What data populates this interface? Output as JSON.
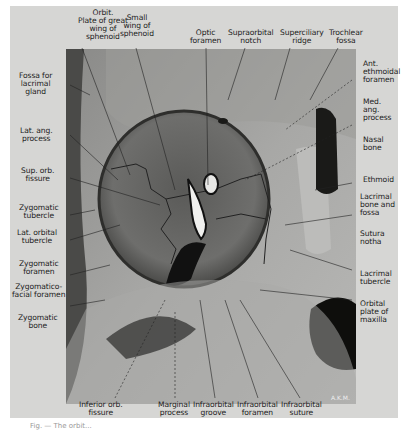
{
  "figure": {
    "signature": "A.K.M.",
    "caption_fragment": "Fig. — The orbit..."
  },
  "labels": {
    "top": [
      {
        "id": "orbit-plate",
        "text": "Orbit.\nPlate of great\nwing of\nsphenoid"
      },
      {
        "id": "small-wing",
        "text": "Small\nwing of\nsphenoid"
      },
      {
        "id": "optic-foramen",
        "text": "Optic\nforamen"
      },
      {
        "id": "supraorbital-notch",
        "text": "Supraorbital\nnotch"
      },
      {
        "id": "superciliary-ridge",
        "text": "Superciliary\nridge"
      },
      {
        "id": "trochlear-fossa",
        "text": "Trochlear\nfossa"
      }
    ],
    "left": [
      {
        "id": "fossa-lacrimal-gland",
        "text": "Fossa for\nlacrimal\ngland"
      },
      {
        "id": "lat-ang-process",
        "text": "Lat. ang.\nprocess"
      },
      {
        "id": "sup-orb-fissure",
        "text": "Sup. orb.\nfissure"
      },
      {
        "id": "zygomatic-tubercle",
        "text": "Zygomatic\ntubercle"
      },
      {
        "id": "lat-orbital-tubercle",
        "text": "Lat. orbital\ntubercle"
      },
      {
        "id": "zygomatic-foramen",
        "text": "Zygomatic\nforamen"
      },
      {
        "id": "zygomaticofacial-foramen",
        "text": "Zygomatico-\nfacial foramen"
      },
      {
        "id": "zygomatic-bone",
        "text": "Zygomatic\nbone"
      }
    ],
    "right": [
      {
        "id": "ant-ethmoidal-foramen",
        "text": "Ant.\nethmoidal\nforamen"
      },
      {
        "id": "med-ang-process",
        "text": "Med.\nang.\nprocess"
      },
      {
        "id": "nasal-bone",
        "text": "Nasal\nbone"
      },
      {
        "id": "ethmoid",
        "text": "Ethmoid"
      },
      {
        "id": "lacrimal-bone-fossa",
        "text": "Lacrimal\nbone and\nfossa"
      },
      {
        "id": "sutura-notha",
        "text": "Sutura\nnotha"
      },
      {
        "id": "lacrimal-tubercle",
        "text": "Lacrimal\ntubercle"
      },
      {
        "id": "orbital-plate-maxilla",
        "text": "Orbital\nplate of\nmaxilla"
      }
    ],
    "bottom": [
      {
        "id": "inferior-orb-fissure",
        "text": "Inferior orb.\nfissure"
      },
      {
        "id": "marginal-process",
        "text": "Marginal\nprocess"
      },
      {
        "id": "infraorbital-groove",
        "text": "Infraorbital\ngroove"
      },
      {
        "id": "infraorbital-foramen",
        "text": "Infraorbital\nforamen"
      },
      {
        "id": "infraorbital-suture",
        "text": "Infraorbital\nsuture"
      }
    ]
  }
}
